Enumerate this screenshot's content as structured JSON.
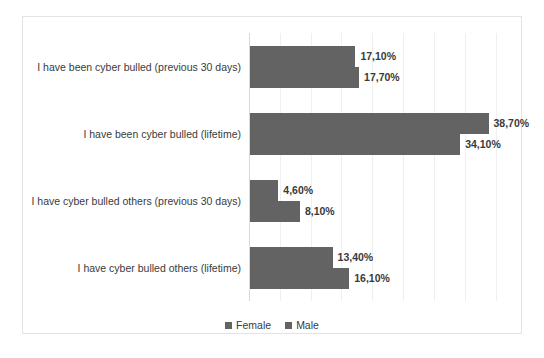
{
  "chart_data": {
    "type": "bar",
    "orientation": "horizontal",
    "title": "",
    "xlabel": "",
    "ylabel": "",
    "xlim": [
      0,
      43
    ],
    "grid": true,
    "grid_step": 5,
    "legend_position": "bottom",
    "accent_color": "#636363",
    "categories": [
      "I have been cyber bulled (previous 30 days)",
      "I have been cyber bulled (lifetime)",
      "I have cyber bulled others (previous 30 days)",
      "I have cyber bulled others (lifetime)"
    ],
    "series": [
      {
        "name": "Female",
        "color": "#636363",
        "values": [
          17.1,
          38.7,
          4.6,
          13.4
        ],
        "labels": [
          "17,10%",
          "38,70%",
          "4,60%",
          "13,40%"
        ]
      },
      {
        "name": "Male",
        "color": "#636363",
        "values": [
          17.7,
          34.1,
          8.1,
          16.1
        ],
        "labels": [
          "17,70%",
          "34,10%",
          "8,10%",
          "16,10%"
        ]
      }
    ]
  },
  "legend": {
    "items": [
      {
        "label": "Female"
      },
      {
        "label": "Male"
      }
    ]
  }
}
